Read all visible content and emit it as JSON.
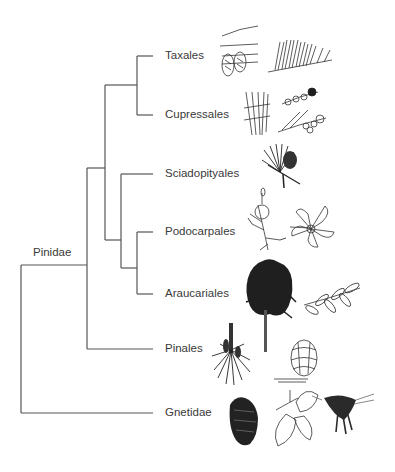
{
  "diagram": {
    "type": "phylogenetic-tree",
    "root_clade_label": "Pinidae",
    "taxa": [
      {
        "label": "Taxales",
        "y": 56,
        "illustrations": [
          "yew-cone-sketch",
          "yew-shoot-sketch"
        ]
      },
      {
        "label": "Cupressales",
        "y": 115,
        "illustrations": [
          "cypress-needles-sketch",
          "cypress-cone-shoot-sketch"
        ]
      },
      {
        "label": "Sciadopityales",
        "y": 174,
        "illustrations": [
          "umbrella-pine-shoot-sketch"
        ]
      },
      {
        "label": "Podocarpales",
        "y": 232,
        "illustrations": [
          "podocarp-shoot-sketch",
          "podocarp-leaf-whorl-sketch"
        ]
      },
      {
        "label": "Araucariales",
        "y": 294,
        "illustrations": [
          "araucaria-tree-sketch",
          "araucaria-leafy-shoot-sketch"
        ]
      },
      {
        "label": "Pinales",
        "y": 349,
        "illustrations": [
          "pine-shoot-sketch",
          "pine-cone-sketch"
        ]
      },
      {
        "label": "Gnetidae",
        "y": 413,
        "illustrations": [
          "gnetum-cone-sketch",
          "gnetum-leaves-sketch",
          "welwitschia-sketch"
        ]
      }
    ],
    "edge_color": "#555555",
    "text_color": "#3a3a3a"
  }
}
